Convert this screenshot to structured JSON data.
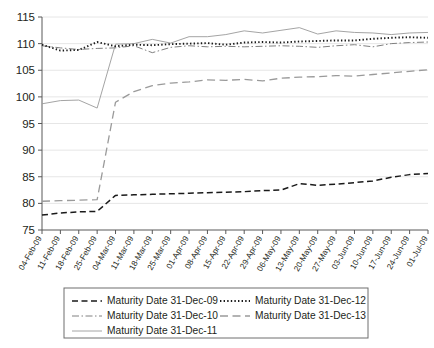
{
  "chart_data": {
    "type": "line",
    "title": "",
    "xlabel": "",
    "ylabel": "",
    "ylim": [
      75,
      115
    ],
    "yticks": [
      75,
      80,
      85,
      90,
      95,
      100,
      105,
      110,
      115
    ],
    "grid": true,
    "legend_position": "bottom",
    "x": [
      "04-Feb-09",
      "11-Feb-09",
      "18-Feb-09",
      "25-Feb-09",
      "04-Mar-09",
      "11-Mar-09",
      "18-Mar-09",
      "25-Mar-09",
      "01-Apr-09",
      "08-Apr-09",
      "15-Apr-09",
      "22-Apr-09",
      "29-Apr-09",
      "06-May-09",
      "13-May-09",
      "20-May-09",
      "27-May-09",
      "03-Jun-09",
      "10-Jun-09",
      "17-Jun-09",
      "24-Jun-09",
      "01-Jul-09"
    ],
    "series": [
      {
        "name": "Maturity Date 31-Dec-09",
        "style": "dashed",
        "color": "#1a1a1a",
        "values": [
          77.8,
          78.2,
          78.4,
          78.5,
          81.5,
          81.6,
          81.7,
          81.8,
          81.9,
          82.0,
          82.1,
          82.2,
          82.4,
          82.5,
          83.7,
          83.4,
          83.6,
          83.9,
          84.2,
          84.9,
          85.4,
          85.6
        ]
      },
      {
        "name": "Maturity Date 31-Dec-10",
        "style": "dash-dot",
        "color": "#808080",
        "values": [
          109.6,
          109.2,
          108.9,
          109.1,
          109.2,
          109.6,
          108.3,
          109.3,
          109.6,
          109.4,
          109.5,
          109.4,
          109.5,
          109.6,
          109.5,
          109.3,
          109.6,
          109.8,
          109.4,
          110.0,
          110.2,
          110.3
        ]
      },
      {
        "name": "Maturity Date 31-Dec-11",
        "style": "solid",
        "color": "#9a9a9a",
        "values": [
          98.7,
          99.3,
          99.4,
          97.9,
          109.9,
          110.0,
          110.8,
          110.1,
          111.3,
          111.3,
          111.7,
          112.4,
          112.0,
          112.5,
          113.0,
          111.8,
          112.4,
          112.1,
          112.0,
          111.7,
          112.0,
          112.1
        ]
      },
      {
        "name": "Maturity Date 31-Dec-12",
        "style": "dotted",
        "color": "#1a1a1a",
        "values": [
          109.8,
          108.7,
          108.8,
          110.3,
          109.5,
          109.8,
          109.7,
          109.9,
          110.0,
          110.1,
          109.8,
          110.2,
          110.3,
          110.2,
          110.4,
          110.5,
          110.6,
          110.6,
          110.9,
          111.1,
          111.2,
          111.1
        ]
      },
      {
        "name": "Maturity Date 31-Dec-13",
        "style": "long-dash",
        "color": "#9a9a9a",
        "values": [
          80.4,
          80.5,
          80.6,
          80.7,
          99.0,
          101.0,
          102.1,
          102.6,
          102.8,
          103.2,
          103.1,
          103.3,
          103.0,
          103.5,
          103.7,
          103.8,
          104.0,
          103.9,
          104.2,
          104.5,
          104.8,
          105.1
        ]
      }
    ]
  },
  "legend": {
    "items": [
      {
        "label": "Maturity Date 31-Dec-09"
      },
      {
        "label": "Maturity Date 31-Dec-12"
      },
      {
        "label": "Maturity Date 31-Dec-10"
      },
      {
        "label": "Maturity Date 31-Dec-13"
      },
      {
        "label": "Maturity Date 31-Dec-11"
      }
    ]
  }
}
